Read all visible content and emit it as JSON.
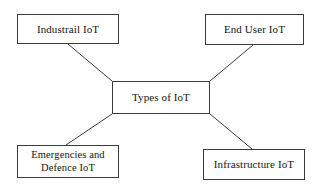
{
  "diagram": {
    "type": "hub-and-spoke",
    "title": "Types of IoT",
    "background_color": "#ffffff",
    "line_color": "#3a3a3a",
    "text_color": "#151515",
    "center": {
      "id": "center",
      "label": "Types of IoT"
    },
    "nodes": [
      {
        "id": "industrial",
        "label": "Industrail IoT",
        "position": "top-left"
      },
      {
        "id": "enduser",
        "label": "End User IoT",
        "position": "top-right"
      },
      {
        "id": "emergencies",
        "label": "Emergencies and\nDefence IoT",
        "position": "bottom-left"
      },
      {
        "id": "infrastructure",
        "label": "Infrastructure IoT",
        "position": "bottom-right"
      }
    ],
    "connectors": [
      {
        "id": "center-to-industrial",
        "from": "center",
        "to": "industrial",
        "x1": 112,
        "y1": 81,
        "x2": 68,
        "y2": 44
      },
      {
        "id": "center-to-enduser",
        "from": "center",
        "to": "enduser",
        "x1": 210,
        "y1": 81,
        "x2": 253,
        "y2": 45
      },
      {
        "id": "center-to-emergencies",
        "from": "center",
        "to": "emergencies",
        "x1": 112,
        "y1": 114,
        "x2": 66,
        "y2": 145
      },
      {
        "id": "center-to-infrastructure",
        "from": "center",
        "to": "infrastructure",
        "x1": 210,
        "y1": 114,
        "x2": 252,
        "y2": 149
      }
    ]
  }
}
